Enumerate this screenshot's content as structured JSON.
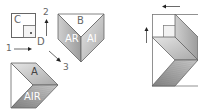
{
  "diagram": {
    "colors": {
      "stroke": "#555555",
      "fill_light": "#d4d4d4",
      "fill_mid": "#bdbdbd",
      "fill_dark": "#9a9a9a",
      "white": "#ffffff",
      "label": "#666666"
    },
    "square": {
      "outer_label": "C",
      "corner_label": "D"
    },
    "steps": {
      "step1": "1",
      "step2": "2",
      "step3": "3"
    },
    "piece_b": {
      "top_label": "B",
      "left_label": "AR",
      "right_label": "AI"
    },
    "piece_a": {
      "top_label": "A",
      "bottom_label": "AIR"
    }
  }
}
